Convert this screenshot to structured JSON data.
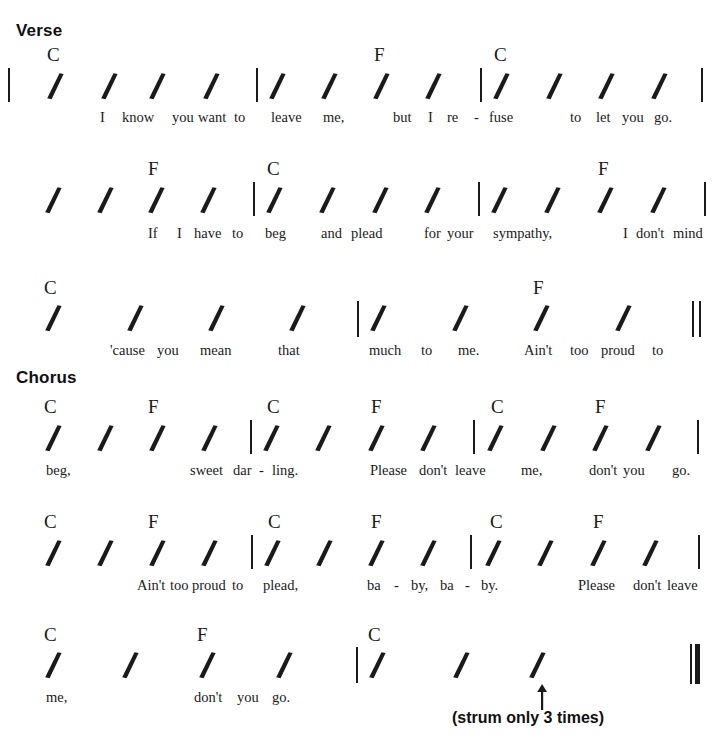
{
  "document": {
    "type": "chord-chart",
    "style": "strum-rhythm-notation",
    "colors": {
      "ink": "#1a1a1a",
      "paper": "#ffffff",
      "heading": "#101010"
    }
  },
  "sections": [
    {
      "id": "verse",
      "label": "Verse",
      "x": 16,
      "y": 22
    },
    {
      "id": "chorus",
      "label": "Chorus",
      "x": 16,
      "y": 369
    }
  ],
  "rows": [
    {
      "id": "row-1",
      "top": 46,
      "barlines": [
        {
          "kind": "single",
          "x": 8,
          "y": 68,
          "h": 34
        },
        {
          "kind": "single",
          "x": 256,
          "y": 68,
          "h": 34
        },
        {
          "kind": "single",
          "x": 480,
          "y": 68,
          "h": 34
        },
        {
          "kind": "single",
          "x": 701,
          "y": 68,
          "h": 34
        }
      ],
      "chords": [
        {
          "name": "C",
          "x": 47,
          "y": 45
        },
        {
          "name": "F",
          "x": 374,
          "y": 45
        },
        {
          "name": "C",
          "x": 494,
          "y": 45
        }
      ],
      "slashes": [
        {
          "x": 46
        },
        {
          "x": 100
        },
        {
          "x": 148
        },
        {
          "x": 202
        },
        {
          "x": 268
        },
        {
          "x": 320
        },
        {
          "x": 372
        },
        {
          "x": 424
        },
        {
          "x": 492
        },
        {
          "x": 545
        },
        {
          "x": 597
        },
        {
          "x": 650
        }
      ],
      "slash_y": 72,
      "lyrics": [
        {
          "text": "I",
          "x": 100
        },
        {
          "text": "know",
          "x": 122
        },
        {
          "text": "you",
          "x": 172
        },
        {
          "text": "want",
          "x": 198
        },
        {
          "text": "to",
          "x": 234
        },
        {
          "text": "leave",
          "x": 271
        },
        {
          "text": "me,",
          "x": 323
        },
        {
          "text": "but",
          "x": 393
        },
        {
          "text": "I",
          "x": 428
        },
        {
          "text": "re",
          "x": 447
        },
        {
          "text": "-",
          "x": 474
        },
        {
          "text": "fuse",
          "x": 489
        },
        {
          "text": "to",
          "x": 570
        },
        {
          "text": "let",
          "x": 596
        },
        {
          "text": "you",
          "x": 622
        },
        {
          "text": "go.",
          "x": 654
        }
      ],
      "lyric_y": 110
    },
    {
      "id": "row-2",
      "top": 160,
      "barlines": [
        {
          "kind": "single",
          "x": 253,
          "y": 182,
          "h": 34
        },
        {
          "kind": "single",
          "x": 478,
          "y": 182,
          "h": 34
        },
        {
          "kind": "single",
          "x": 704,
          "y": 182,
          "h": 34
        }
      ],
      "chords": [
        {
          "name": "F",
          "x": 148,
          "y": 159
        },
        {
          "name": "C",
          "x": 267,
          "y": 159
        },
        {
          "name": "F",
          "x": 598,
          "y": 159
        }
      ],
      "slashes": [
        {
          "x": 44
        },
        {
          "x": 96
        },
        {
          "x": 147
        },
        {
          "x": 199
        },
        {
          "x": 265
        },
        {
          "x": 318
        },
        {
          "x": 371
        },
        {
          "x": 423
        },
        {
          "x": 490
        },
        {
          "x": 543
        },
        {
          "x": 596
        },
        {
          "x": 649
        }
      ],
      "slash_y": 186,
      "lyrics": [
        {
          "text": "If",
          "x": 148
        },
        {
          "text": "I",
          "x": 177
        },
        {
          "text": "have",
          "x": 194
        },
        {
          "text": "to",
          "x": 232
        },
        {
          "text": "beg",
          "x": 265
        },
        {
          "text": "and",
          "x": 321
        },
        {
          "text": "plead",
          "x": 351
        },
        {
          "text": "for",
          "x": 424
        },
        {
          "text": "your",
          "x": 447
        },
        {
          "text": "sympathy,",
          "x": 493
        },
        {
          "text": "I",
          "x": 623
        },
        {
          "text": "don't",
          "x": 636
        },
        {
          "text": "mind",
          "x": 673
        }
      ],
      "lyric_y": 226
    },
    {
      "id": "row-3",
      "top": 275,
      "barlines": [
        {
          "kind": "single",
          "x": 357,
          "y": 301,
          "h": 36
        },
        {
          "kind": "double",
          "x": 692,
          "y": 301,
          "h": 36
        }
      ],
      "chords": [
        {
          "name": "C",
          "x": 44,
          "y": 278
        },
        {
          "name": "F",
          "x": 533,
          "y": 278
        }
      ],
      "slashes": [
        {
          "x": 44
        },
        {
          "x": 126
        },
        {
          "x": 207
        },
        {
          "x": 288
        },
        {
          "x": 369
        },
        {
          "x": 451
        },
        {
          "x": 532
        },
        {
          "x": 614
        }
      ],
      "slash_y": 304,
      "lyrics": [
        {
          "text": "'cause",
          "x": 110
        },
        {
          "text": "you",
          "x": 157
        },
        {
          "text": "mean",
          "x": 200
        },
        {
          "text": "that",
          "x": 278
        },
        {
          "text": "much",
          "x": 369
        },
        {
          "text": "to",
          "x": 421
        },
        {
          "text": "me.",
          "x": 458
        },
        {
          "text": "Ain't",
          "x": 524
        },
        {
          "text": "too",
          "x": 570
        },
        {
          "text": "proud",
          "x": 601
        },
        {
          "text": "to",
          "x": 652
        }
      ],
      "lyric_y": 343
    },
    {
      "id": "row-4",
      "top": 393,
      "barlines": [
        {
          "kind": "single",
          "x": 250,
          "y": 420,
          "h": 34
        },
        {
          "kind": "single",
          "x": 473,
          "y": 420,
          "h": 34
        },
        {
          "kind": "single",
          "x": 697,
          "y": 420,
          "h": 34
        }
      ],
      "chords": [
        {
          "name": "C",
          "x": 44,
          "y": 397
        },
        {
          "name": "F",
          "x": 148,
          "y": 397
        },
        {
          "name": "C",
          "x": 267,
          "y": 397
        },
        {
          "name": "F",
          "x": 371,
          "y": 397
        },
        {
          "name": "C",
          "x": 491,
          "y": 397
        },
        {
          "name": "F",
          "x": 595,
          "y": 397
        }
      ],
      "slashes": [
        {
          "x": 44
        },
        {
          "x": 96
        },
        {
          "x": 148
        },
        {
          "x": 200
        },
        {
          "x": 262
        },
        {
          "x": 314
        },
        {
          "x": 367
        },
        {
          "x": 419
        },
        {
          "x": 486
        },
        {
          "x": 539
        },
        {
          "x": 591
        },
        {
          "x": 644
        }
      ],
      "slash_y": 424,
      "lyrics": [
        {
          "text": "beg,",
          "x": 46
        },
        {
          "text": "sweet",
          "x": 190
        },
        {
          "text": "dar",
          "x": 233
        },
        {
          "text": "-",
          "x": 259
        },
        {
          "text": "ling.",
          "x": 272
        },
        {
          "text": "Please",
          "x": 370
        },
        {
          "text": "don't",
          "x": 419
        },
        {
          "text": "leave",
          "x": 455
        },
        {
          "text": "me,",
          "x": 521
        },
        {
          "text": "don't",
          "x": 589
        },
        {
          "text": "you",
          "x": 623
        },
        {
          "text": "go.",
          "x": 672
        }
      ],
      "lyric_y": 463
    },
    {
      "id": "row-5",
      "top": 508,
      "barlines": [
        {
          "kind": "single",
          "x": 251,
          "y": 535,
          "h": 34
        },
        {
          "kind": "single",
          "x": 470,
          "y": 535,
          "h": 34
        },
        {
          "kind": "single",
          "x": 698,
          "y": 535,
          "h": 34
        }
      ],
      "chords": [
        {
          "name": "C",
          "x": 44,
          "y": 512
        },
        {
          "name": "F",
          "x": 148,
          "y": 512
        },
        {
          "name": "C",
          "x": 268,
          "y": 512
        },
        {
          "name": "F",
          "x": 371,
          "y": 512
        },
        {
          "name": "C",
          "x": 490,
          "y": 512
        },
        {
          "name": "F",
          "x": 593,
          "y": 512
        }
      ],
      "slashes": [
        {
          "x": 44
        },
        {
          "x": 96
        },
        {
          "x": 148
        },
        {
          "x": 200
        },
        {
          "x": 263
        },
        {
          "x": 315
        },
        {
          "x": 367
        },
        {
          "x": 419
        },
        {
          "x": 484
        },
        {
          "x": 536
        },
        {
          "x": 589
        },
        {
          "x": 641
        }
      ],
      "slash_y": 539,
      "lyrics": [
        {
          "text": "Ain't",
          "x": 137
        },
        {
          "text": "too",
          "x": 170
        },
        {
          "text": "proud",
          "x": 192
        },
        {
          "text": "to",
          "x": 232
        },
        {
          "text": "plead,",
          "x": 263
        },
        {
          "text": "ba",
          "x": 367
        },
        {
          "text": "-",
          "x": 394
        },
        {
          "text": "by,",
          "x": 411
        },
        {
          "text": "ba",
          "x": 440
        },
        {
          "text": "-",
          "x": 465
        },
        {
          "text": "by.",
          "x": 481
        },
        {
          "text": "Please",
          "x": 578
        },
        {
          "text": "don't",
          "x": 633
        },
        {
          "text": "leave",
          "x": 667
        }
      ],
      "lyric_y": 578
    },
    {
      "id": "row-6",
      "top": 622,
      "barlines": [
        {
          "kind": "single",
          "x": 356,
          "y": 647,
          "h": 36
        },
        {
          "kind": "final",
          "x": 690,
          "y": 644,
          "h": 40
        }
      ],
      "chords": [
        {
          "name": "C",
          "x": 44,
          "y": 625
        },
        {
          "name": "F",
          "x": 197,
          "y": 625
        },
        {
          "name": "C",
          "x": 368,
          "y": 625
        }
      ],
      "slashes": [
        {
          "x": 44
        },
        {
          "x": 121
        },
        {
          "x": 198
        },
        {
          "x": 275
        },
        {
          "x": 368
        },
        {
          "x": 452
        },
        {
          "x": 528
        }
      ],
      "slash_y": 651,
      "lyrics": [
        {
          "text": "me,",
          "x": 46
        },
        {
          "text": "don't",
          "x": 194
        },
        {
          "text": "you",
          "x": 237
        },
        {
          "text": "go.",
          "x": 272
        }
      ],
      "lyric_y": 690
    }
  ],
  "annotations": [
    {
      "id": "strum-note",
      "text": "(strum only 3 times)",
      "x": 452,
      "y": 710,
      "arrow": {
        "x": 536,
        "y": 684,
        "height": 26
      }
    }
  ]
}
